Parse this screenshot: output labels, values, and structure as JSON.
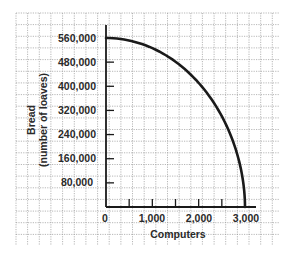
{
  "chart_data": {
    "type": "line",
    "title": "",
    "xlabel": "Computers",
    "ylabel": "Bread",
    "ylabel_sub": "(number of loaves)",
    "x_ticks": [
      "0",
      "1,000",
      "2,000",
      "3,000"
    ],
    "x_tick_values": [
      0,
      1000,
      2000,
      3000
    ],
    "y_ticks": [
      "80,000",
      "160,000",
      "240,000",
      "320,000",
      "400,000",
      "480,000",
      "560,000"
    ],
    "y_tick_values": [
      80000,
      160000,
      240000,
      320000,
      400000,
      480000,
      560000
    ],
    "xlim": [
      0,
      3000
    ],
    "ylim": [
      0,
      560000
    ],
    "grid": true,
    "legend": null,
    "series": [
      {
        "name": "Production possibilities frontier",
        "x": [
          0,
          500,
          1000,
          1500,
          2000,
          2500,
          2800,
          3000
        ],
        "values": [
          560000,
          545000,
          520000,
          470000,
          400000,
          280000,
          160000,
          0
        ]
      }
    ]
  },
  "colors": {
    "grid": "#9a9a9a",
    "axis": "#1a1a1a",
    "curve": "#1a1a1a",
    "text": "#2a2a2a"
  }
}
